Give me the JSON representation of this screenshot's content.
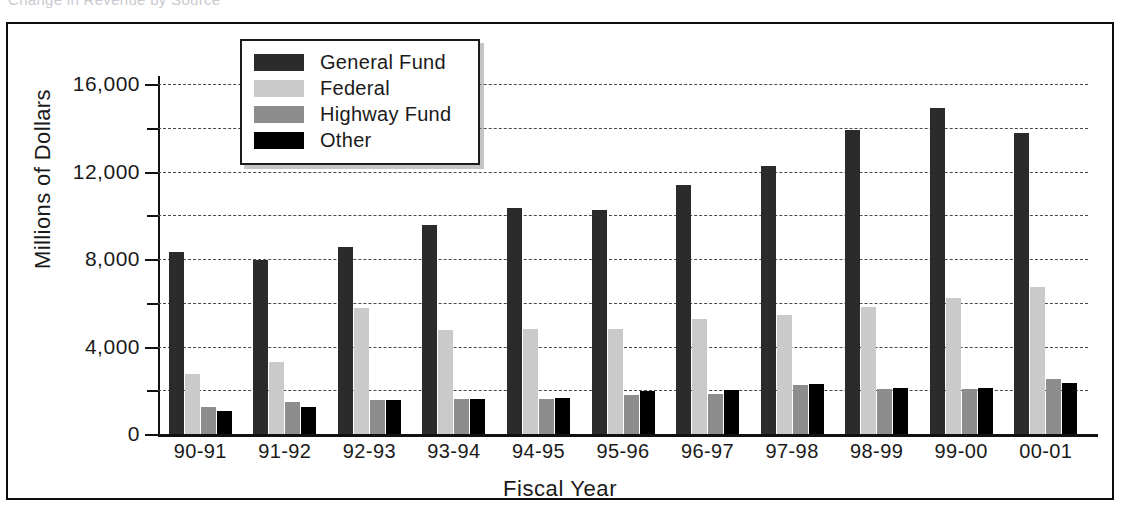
{
  "caption_clipped": "Change in Revenue by Source",
  "chart_data": {
    "type": "bar",
    "title": "",
    "xlabel": "Fiscal Year",
    "ylabel": "Millions of Dollars",
    "ylim": [
      0,
      16000
    ],
    "ytick_values": [
      0,
      4000,
      8000,
      12000,
      16000
    ],
    "ytick_labels": [
      "0",
      "4,000",
      "8,000",
      "12,000",
      "16,000"
    ],
    "yminor_values": [
      2000,
      6000,
      10000,
      14000
    ],
    "grid": true,
    "legend_position": "top-center",
    "categories": [
      "90-91",
      "91-92",
      "92-93",
      "93-94",
      "94-95",
      "95-96",
      "96-97",
      "97-98",
      "98-99",
      "99-00",
      "00-01"
    ],
    "series": [
      {
        "name": "General Fund",
        "color": "#2b2b2b",
        "values": [
          8300,
          7950,
          8550,
          9550,
          10350,
          10250,
          11400,
          12250,
          13900,
          14900,
          13750
        ]
      },
      {
        "name": "Federal",
        "color": "#cacaca",
        "values": [
          2750,
          3300,
          5750,
          4750,
          4800,
          4800,
          5250,
          5450,
          5800,
          6200,
          6700
        ]
      },
      {
        "name": "Highway Fund",
        "color": "#8d8d8d",
        "values": [
          1250,
          1450,
          1550,
          1600,
          1600,
          1800,
          1850,
          2250,
          2050,
          2050,
          2500
        ]
      },
      {
        "name": "Other",
        "color": "#000000",
        "values": [
          1050,
          1250,
          1550,
          1600,
          1650,
          1950,
          2000,
          2300,
          2100,
          2100,
          2350
        ]
      }
    ]
  }
}
